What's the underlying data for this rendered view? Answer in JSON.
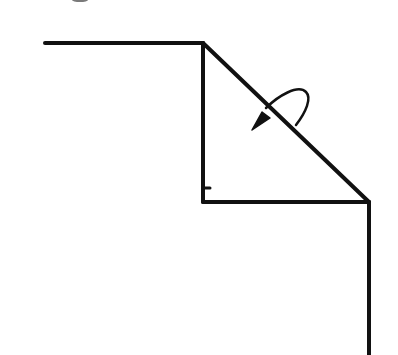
{
  "diagram": {
    "type": "fold-diagram",
    "background": "#ffffff",
    "stroke_color": "#111111",
    "elements": [
      {
        "name": "top-edge-line",
        "from": [
          45,
          43
        ],
        "to": [
          203,
          43
        ]
      },
      {
        "name": "left-vertical-line",
        "from": [
          203,
          43
        ],
        "to": [
          203,
          202
        ]
      },
      {
        "name": "diagonal-fold-line",
        "from": [
          203,
          43
        ],
        "to": [
          369,
          202
        ]
      },
      {
        "name": "bottom-edge-line",
        "from": [
          203,
          202
        ],
        "to": [
          369,
          202
        ]
      },
      {
        "name": "right-vertical-line",
        "from": [
          369,
          202
        ],
        "to": [
          369,
          355
        ]
      }
    ],
    "annotations": [
      {
        "name": "fold-over-arrow",
        "meaning": "fold over along diagonal"
      }
    ]
  }
}
